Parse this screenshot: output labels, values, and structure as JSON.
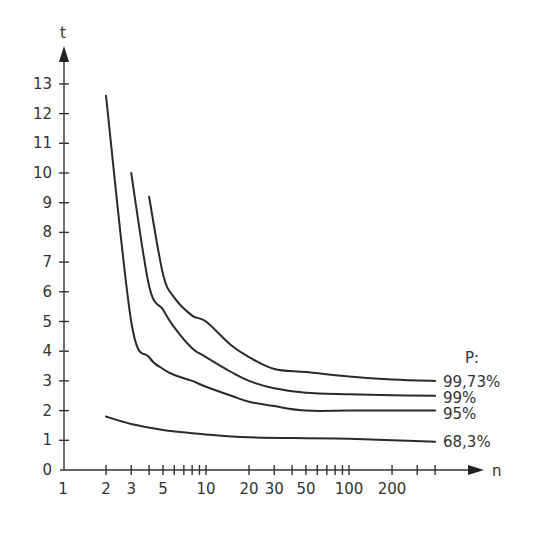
{
  "chart_data": {
    "type": "line",
    "title": "",
    "xlabel": "n",
    "ylabel": "t",
    "x_scale": "log",
    "x_tick_labels": [
      "1",
      "2",
      "3",
      "5",
      "10",
      "20",
      "30",
      "50",
      "100",
      "200"
    ],
    "x_ticks": [
      1,
      2,
      3,
      4,
      5,
      6,
      7,
      8,
      9,
      10,
      20,
      30,
      40,
      50,
      60,
      70,
      80,
      90,
      100,
      200,
      300,
      400
    ],
    "y_tick_labels": [
      "0",
      "1",
      "2",
      "3",
      "4",
      "5",
      "6",
      "7",
      "8",
      "9",
      "10",
      "11",
      "12",
      "13"
    ],
    "ylim": [
      0,
      13
    ],
    "grid": false,
    "legend_title": "P:",
    "legend_position": "right",
    "series": [
      {
        "name": "99,73%",
        "x": [
          4,
          5,
          6,
          8,
          10,
          15,
          20,
          30,
          50,
          100,
          200,
          400
        ],
        "y": [
          9.2,
          6.6,
          5.8,
          5.2,
          5.0,
          4.2,
          3.8,
          3.4,
          3.3,
          3.15,
          3.05,
          3.0
        ]
      },
      {
        "name": "99%",
        "x": [
          3,
          4,
          5,
          6,
          8,
          10,
          15,
          20,
          30,
          50,
          100,
          200,
          400
        ],
        "y": [
          10.0,
          6.2,
          5.4,
          4.8,
          4.1,
          3.8,
          3.3,
          3.0,
          2.75,
          2.6,
          2.55,
          2.52,
          2.5
        ]
      },
      {
        "name": "95%",
        "x": [
          2,
          3,
          4,
          5,
          6,
          8,
          10,
          15,
          20,
          30,
          50,
          100,
          200,
          400
        ],
        "y": [
          12.6,
          5.0,
          3.8,
          3.4,
          3.2,
          3.0,
          2.8,
          2.5,
          2.3,
          2.15,
          2.0,
          2.0,
          2.0,
          2.0
        ]
      },
      {
        "name": "68,3%",
        "x": [
          2,
          3,
          5,
          10,
          20,
          50,
          100,
          200,
          400
        ],
        "y": [
          1.8,
          1.55,
          1.35,
          1.2,
          1.1,
          1.07,
          1.05,
          1.0,
          0.95
        ]
      }
    ]
  },
  "labels": {
    "y_axis": "t",
    "x_axis": "n",
    "legend_title": "P:",
    "legend": [
      "99,73%",
      "99%",
      "95%",
      "68,3%"
    ]
  }
}
